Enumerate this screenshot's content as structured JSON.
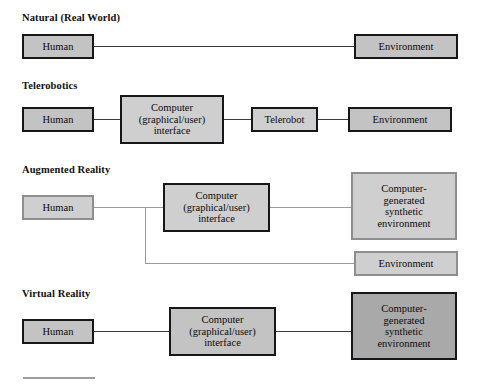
{
  "diagram": {
    "sections": [
      {
        "id": "natural",
        "label": "Natural (Real World)",
        "nodes": [
          {
            "id": "natural-human",
            "label": "Human",
            "border_color": "#17171a",
            "fill_color": "#c3c3c3"
          },
          {
            "id": "natural-environment",
            "label": "Environment",
            "border_color": "#17171a",
            "fill_color": "#c3c3c3"
          }
        ],
        "links": [
          {
            "from": "natural-human",
            "to": "natural-environment",
            "color": "#3b3b3f"
          }
        ]
      },
      {
        "id": "telerobotics",
        "label": "Telerobotics",
        "nodes": [
          {
            "id": "tele-human",
            "label": "Human",
            "border_color": "#17171a",
            "fill_color": "#c3c3c3"
          },
          {
            "id": "tele-computer",
            "label": "Computer (graphical/user) interface",
            "line1": "Computer",
            "line2": "(graphical/user)",
            "line3": "interface",
            "border_color": "#17171a",
            "fill_color": "#cfcfcf"
          },
          {
            "id": "tele-telerobot",
            "label": "Telerobot",
            "border_color": "#17171a",
            "fill_color": "#cfcfcf"
          },
          {
            "id": "tele-environment",
            "label": "Environment",
            "border_color": "#17171a",
            "fill_color": "#c3c3c3"
          }
        ],
        "links": [
          {
            "from": "tele-human",
            "to": "tele-computer",
            "color": "#3b3b3f"
          },
          {
            "from": "tele-computer",
            "to": "tele-telerobot",
            "color": "#3b3b3f"
          },
          {
            "from": "tele-telerobot",
            "to": "tele-environment",
            "color": "#3b3b3f"
          }
        ]
      },
      {
        "id": "augmented-reality",
        "label": "Augmented Reality",
        "nodes": [
          {
            "id": "ar-human",
            "label": "Human",
            "border_color": "#8d8d92",
            "fill_color": "#cfcfcf"
          },
          {
            "id": "ar-computer",
            "label": "Computer (graphical/user) interface",
            "line1": "Computer",
            "line2": "(graphical/user)",
            "line3": "interface",
            "border_color": "#17171a",
            "fill_color": "#cfcfcf"
          },
          {
            "id": "ar-synthetic",
            "label": "Computer-generated synthetic environment",
            "line1": "Computer-",
            "line2": "generated",
            "line3": "synthetic",
            "line4": "environment",
            "border_color": "#8d8d92",
            "fill_color": "#cfcfcf"
          },
          {
            "id": "ar-environment",
            "label": "Environment",
            "border_color": "#8d8d92",
            "fill_color": "#cfcfcf"
          }
        ],
        "links": [
          {
            "from": "ar-human",
            "to": "ar-computer",
            "color": "#9a9a9e"
          },
          {
            "from": "ar-computer",
            "to": "ar-synthetic",
            "color": "#9a9a9e"
          },
          {
            "from": "ar-human-branch",
            "to": "ar-environment",
            "color": "#9a9a9e"
          }
        ]
      },
      {
        "id": "virtual-reality",
        "label": "Virtual Reality",
        "nodes": [
          {
            "id": "vr-human",
            "label": "Human",
            "border_color": "#17171a",
            "fill_color": "#c3c3c3"
          },
          {
            "id": "vr-computer",
            "label": "Computer (graphical/user) interface",
            "line1": "Computer",
            "line2": "(graphical/user)",
            "line3": "interface",
            "border_color": "#17171a",
            "fill_color": "#c3c3c3"
          },
          {
            "id": "vr-synthetic",
            "label": "Computer-generated synthetic environment",
            "line1": "Computer-",
            "line2": "generated",
            "line3": "synthetic",
            "line4": "environment",
            "border_color": "#17171a",
            "fill_color": "#a9a9a9"
          }
        ],
        "links": [
          {
            "from": "vr-human",
            "to": "vr-computer",
            "color": "#3b3b3f"
          },
          {
            "from": "vr-computer",
            "to": "vr-synthetic",
            "color": "#3b3b3f"
          }
        ]
      }
    ]
  }
}
